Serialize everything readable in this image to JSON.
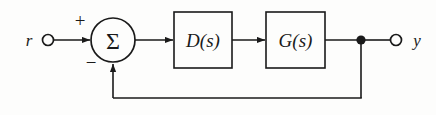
{
  "figure": {
    "name": "feedback-control-block-diagram",
    "background_color": "#fdfdfc",
    "line_color": "#1a1a1a"
  },
  "signals": {
    "input_label": "r",
    "output_label": "y"
  },
  "summing_junction": {
    "glyph": "Σ",
    "positive_sign": "+",
    "negative_sign": "−"
  },
  "blocks": [
    {
      "id": "controller",
      "label": "D(s)"
    },
    {
      "id": "plant",
      "label": "G(s)"
    }
  ],
  "geometry": {
    "main_line_y": 40,
    "feedback_line_y": 98,
    "sum_center_x": 113,
    "sum_center_y": 40,
    "sum_radius": 22,
    "input_terminal_x": 48,
    "output_terminal_x": 396,
    "takeoff_node_x": 361,
    "controller_box": {
      "x": 174,
      "y": 12,
      "w": 58,
      "h": 56
    },
    "plant_box": {
      "x": 266,
      "y": 12,
      "w": 59,
      "h": 56
    }
  }
}
